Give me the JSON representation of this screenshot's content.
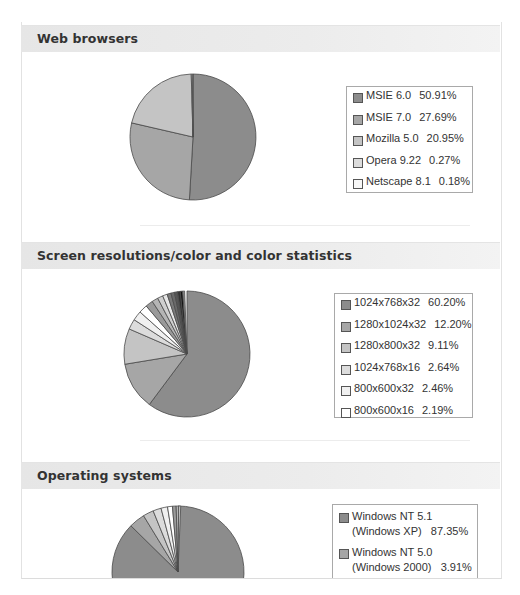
{
  "sections": [
    {
      "title": "Web browsers",
      "legend": [
        {
          "label": "MSIE 6.0",
          "pct": "50.91%",
          "color": "#8c8c8c"
        },
        {
          "label": "MSIE 7.0",
          "pct": "27.69%",
          "color": "#a6a6a6"
        },
        {
          "label": "Mozilla 5.0",
          "pct": "20.95%",
          "color": "#c4c4c4"
        },
        {
          "label": "Opera 9.22",
          "pct": "0.27%",
          "color": "#dcdcdc"
        },
        {
          "label": "Netscape 8.1",
          "pct": "0.18%",
          "color": "#f7f7f7"
        }
      ]
    },
    {
      "title": "Screen resolutions/color and color statistics",
      "legend": [
        {
          "label": "1024x768x32",
          "pct": "60.20%",
          "color": "#8c8c8c"
        },
        {
          "label": "1280x1024x32",
          "pct": "12.20%",
          "color": "#a6a6a6"
        },
        {
          "label": "1280x800x32",
          "pct": "9.11%",
          "color": "#c4c4c4"
        },
        {
          "label": "1024x768x16",
          "pct": "2.64%",
          "color": "#dcdcdc"
        },
        {
          "label": "800x600x32",
          "pct": "2.46%",
          "color": "#f0f0f0"
        },
        {
          "label": "800x600x16",
          "pct": "2.19%",
          "color": "#ffffff"
        }
      ]
    },
    {
      "title": "Operating systems",
      "legend": [
        {
          "label": "Windows NT 5.1 (Windows XP)",
          "pct": "87.35%",
          "color": "#8c8c8c"
        },
        {
          "label": "Windows NT 5.0 (Windows 2000)",
          "pct": "3.91%",
          "color": "#a6a6a6"
        }
      ]
    }
  ],
  "chart_data": [
    {
      "type": "pie",
      "title": "Web browsers",
      "categories": [
        "MSIE 6.0",
        "MSIE 7.0",
        "Mozilla 5.0",
        "Opera 9.22",
        "Netscape 8.1"
      ],
      "values": [
        50.91,
        27.69,
        20.95,
        0.27,
        0.18
      ],
      "legend_position": "right"
    },
    {
      "type": "pie",
      "title": "Screen resolutions/color and color statistics",
      "categories": [
        "1024x768x32",
        "1280x1024x32",
        "1280x800x32",
        "1024x768x16",
        "800x600x32",
        "800x600x16"
      ],
      "values": [
        60.2,
        12.2,
        9.11,
        2.64,
        2.46,
        2.19
      ],
      "legend_position": "right"
    },
    {
      "type": "pie",
      "title": "Operating systems",
      "categories": [
        "Windows NT 5.1 (Windows XP)",
        "Windows NT 5.0 (Windows 2000)"
      ],
      "values": [
        87.35,
        3.91
      ],
      "legend_position": "right"
    }
  ]
}
